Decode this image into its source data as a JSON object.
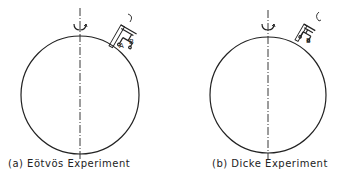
{
  "figure": {
    "panels": [
      {
        "id": "a",
        "caption": "(a) Eötvös Experiment",
        "labels": {
          "mass_a": "A",
          "mass_b": "B"
        }
      },
      {
        "id": "b",
        "caption": "(b) Dicke Experiment",
        "labels": {
          "mass_a": "A",
          "mass_b": "B"
        }
      }
    ],
    "colors": {
      "stroke": "#222222",
      "background": "#ffffff"
    }
  }
}
